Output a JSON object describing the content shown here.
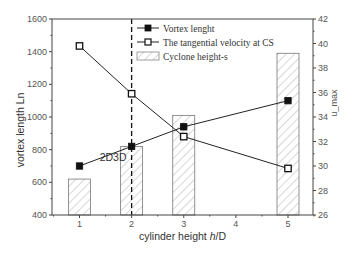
{
  "chart_data": {
    "type": "bar+line",
    "title": "",
    "xlabel": "cylinder height h/D",
    "xlabel_parts": {
      "pre": "cylinder height ",
      "italic": "h",
      "post": "/D"
    },
    "ylabel": "vortex length Ln",
    "ylabel_right": "u_max",
    "x": [
      1,
      2,
      3,
      5
    ],
    "x_ticks": [
      "1",
      "2",
      "3",
      "4",
      "5"
    ],
    "xlim": [
      0.45,
      5.5
    ],
    "ylim": [
      400,
      1600
    ],
    "y_ticks": [
      "400",
      "600",
      "800",
      "1000",
      "1200",
      "1400",
      "1600"
    ],
    "ylim_right": [
      26,
      42
    ],
    "y_ticks_right": [
      "26",
      "28",
      "30",
      "32",
      "34",
      "36",
      "38",
      "40",
      "42"
    ],
    "series": [
      {
        "name": "Vortex lenght",
        "type": "line",
        "marker": "filled-square",
        "axis": "left",
        "values": [
          700,
          820,
          940,
          1100
        ]
      },
      {
        "name": "The  tangential velocity at CS",
        "type": "line",
        "marker": "open-square",
        "axis": "right",
        "values": [
          39.8,
          35.9,
          32.4,
          29.8
        ]
      },
      {
        "name": "Cyclone height-s",
        "type": "bar",
        "pattern": "hatched",
        "axis": "left",
        "values": [
          620,
          820,
          1010,
          1390
        ]
      }
    ],
    "annotations": [
      {
        "text": "2D3D",
        "x": 2,
        "type": "dashed-vertical-line"
      }
    ],
    "legend_position": "top-center",
    "grid": false
  },
  "colors": {
    "line": "#222222",
    "axis": "#444444",
    "hatch": "#999999",
    "bar_edge": "#777777"
  }
}
